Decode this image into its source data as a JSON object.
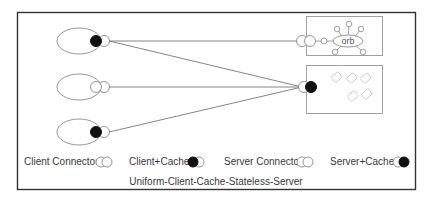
{
  "diagram": {
    "title": "Uniform-Client-Cache-Stateless-Server",
    "colors": {
      "frame": "#333333",
      "line": "#777777",
      "shape_stroke": "#8a8a8a",
      "cache_fill": "#111111",
      "text": "#3a3a3a",
      "box_stroke": "#999999",
      "resource_stroke": "#c8c8c8"
    },
    "clients": [
      {
        "id": "client-1",
        "has_cache": true
      },
      {
        "id": "client-2",
        "has_cache": false
      },
      {
        "id": "client-3",
        "has_cache": true
      }
    ],
    "servers": [
      {
        "id": "orb-server",
        "label": "orb",
        "connector": "server-connector",
        "has_cache": false
      },
      {
        "id": "cache-server",
        "label": "",
        "connector": "server-cache",
        "has_cache": true
      }
    ],
    "connections": [
      {
        "from": "client-1",
        "to": "orb-server"
      },
      {
        "from": "client-1",
        "to": "cache-server"
      },
      {
        "from": "client-2",
        "to": "cache-server"
      },
      {
        "from": "client-3",
        "to": "cache-server"
      }
    ],
    "legend": [
      {
        "label": "Client Connector:",
        "icon": "client-connector-icon"
      },
      {
        "label": "Client+Cache:",
        "icon": "client-cache-icon"
      },
      {
        "label": "Server Connector:",
        "icon": "server-connector-icon"
      },
      {
        "label": "Server+Cache:",
        "icon": "server-cache-icon"
      }
    ]
  }
}
